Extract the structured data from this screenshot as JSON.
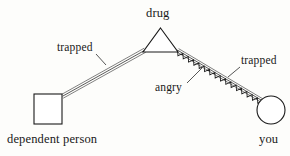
{
  "diagram": {
    "type": "relationship-genogram",
    "caption_font": "serif",
    "background_color": "#fdfdfb",
    "line_color": "#2b2b2b",
    "nodes": [
      {
        "id": "drug",
        "label": "drug",
        "shape": "triangle",
        "cx": 160.5,
        "cy": 41,
        "apex_x": 160.5,
        "apex_y": 28,
        "base_left_x": 143,
        "base_right_x": 178,
        "base_y": 52,
        "label_position": "above"
      },
      {
        "id": "dependent-person",
        "label": "dependent person",
        "shape": "square",
        "x": 34,
        "y": 94,
        "width": 28,
        "height": 30,
        "label_position": "below"
      },
      {
        "id": "you",
        "label": "you",
        "shape": "circle",
        "cx": 271,
        "cy": 110,
        "r": 14,
        "label_position": "below"
      }
    ],
    "connections": [
      {
        "id": "dependent-to-drug",
        "from": "dependent-person",
        "to": "drug",
        "relation_label": "trapped",
        "style": "triple-line",
        "x1": 62,
        "y1": 96,
        "x2": 145,
        "y2": 50
      },
      {
        "id": "drug-to-you",
        "from": "drug",
        "to": "you",
        "relation_label": "trapped",
        "secondary_label": "angry",
        "style": "triple-line-with-zigzag",
        "x1": 177,
        "y1": 50,
        "x2": 262,
        "y2": 101
      }
    ],
    "relation_labels": [
      {
        "id": "trapped-left",
        "text": "trapped"
      },
      {
        "id": "trapped-right",
        "text": "trapped"
      },
      {
        "id": "angry",
        "text": "angry"
      }
    ]
  }
}
